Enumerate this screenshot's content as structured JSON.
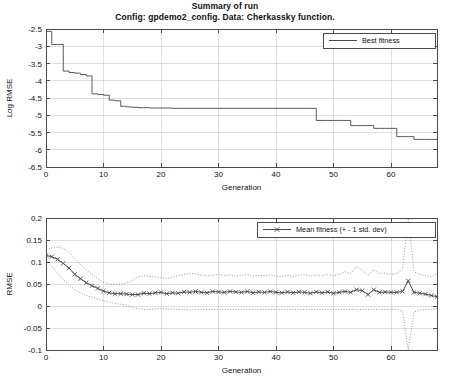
{
  "title": {
    "line1": "Summary of run",
    "line2": "Config: gpdemo2_config. Data: Cherkassky function."
  },
  "colors": {
    "frame": "#4a4a4a",
    "grid": "#c9c9c9",
    "series": "#5a5a5a",
    "band": "#8a8a8a",
    "background": "#ffffff"
  },
  "chart_data": [
    {
      "type": "line",
      "id": "best-fitness-chart",
      "title": "",
      "xlabel": "Generation",
      "ylabel": "Log RMSE",
      "xlim": [
        0,
        68
      ],
      "ylim": [
        -6.5,
        -2.5
      ],
      "xticks": [
        0,
        10,
        20,
        30,
        40,
        50,
        60
      ],
      "yticks": [
        -2.5,
        -3,
        -3.5,
        -4,
        -4.5,
        -5,
        -5.5,
        -6,
        -6.5
      ],
      "grid": true,
      "drawstyle": "steps-post",
      "legend": {
        "position": "top-right",
        "entries": [
          "Best fitness"
        ]
      },
      "series": [
        {
          "name": "Best fitness",
          "style": "step",
          "x": [
            0,
            1,
            2,
            3,
            4,
            5,
            6,
            7,
            8,
            9,
            10,
            11,
            12,
            13,
            14,
            15,
            16,
            17,
            18,
            19,
            20,
            21,
            22,
            23,
            30,
            40,
            46,
            47,
            48,
            49,
            50,
            51,
            52,
            53,
            54,
            55,
            56,
            57,
            58,
            59,
            60,
            61,
            62,
            63,
            64,
            65,
            66,
            67,
            68
          ],
          "y": [
            -2.57,
            -2.95,
            -2.95,
            -3.72,
            -3.76,
            -3.78,
            -3.82,
            -3.86,
            -4.38,
            -4.4,
            -4.42,
            -4.56,
            -4.58,
            -4.74,
            -4.76,
            -4.77,
            -4.78,
            -4.78,
            -4.79,
            -4.79,
            -4.79,
            -4.79,
            -4.8,
            -4.8,
            -4.8,
            -4.8,
            -4.8,
            -5.15,
            -5.15,
            -5.15,
            -5.15,
            -5.15,
            -5.15,
            -5.3,
            -5.3,
            -5.3,
            -5.3,
            -5.38,
            -5.38,
            -5.38,
            -5.38,
            -5.62,
            -5.62,
            -5.62,
            -5.7,
            -5.7,
            -5.7,
            -5.7,
            -5.7
          ]
        }
      ]
    },
    {
      "type": "line",
      "id": "mean-fitness-chart",
      "title": "",
      "xlabel": "Generation",
      "ylabel": "RMSE",
      "xlim": [
        0,
        68
      ],
      "ylim": [
        -0.1,
        0.2
      ],
      "xticks": [
        0,
        10,
        20,
        30,
        40,
        50,
        60
      ],
      "yticks": [
        0.2,
        0.15,
        0.1,
        0.05,
        0,
        -0.05,
        -0.1
      ],
      "grid": true,
      "legend": {
        "position": "top-right",
        "entries": [
          "Mean fitness (+ - 1 std. dev)"
        ]
      },
      "x": [
        0,
        1,
        2,
        3,
        4,
        5,
        6,
        7,
        8,
        9,
        10,
        11,
        12,
        13,
        14,
        15,
        16,
        17,
        18,
        19,
        20,
        21,
        22,
        23,
        24,
        25,
        26,
        27,
        28,
        29,
        30,
        31,
        32,
        33,
        34,
        35,
        36,
        37,
        38,
        39,
        40,
        41,
        42,
        43,
        44,
        45,
        46,
        47,
        48,
        49,
        50,
        51,
        52,
        53,
        54,
        55,
        56,
        57,
        58,
        59,
        60,
        61,
        62,
        63,
        64,
        65,
        66,
        67,
        68
      ],
      "series": [
        {
          "name": "Mean fitness",
          "style": "line-marker",
          "marker": "x",
          "values": [
            0.115,
            0.112,
            0.106,
            0.097,
            0.086,
            0.072,
            0.062,
            0.053,
            0.046,
            0.04,
            0.034,
            0.03,
            0.028,
            0.028,
            0.027,
            0.026,
            0.026,
            0.029,
            0.028,
            0.03,
            0.031,
            0.028,
            0.03,
            0.029,
            0.032,
            0.031,
            0.033,
            0.031,
            0.03,
            0.033,
            0.032,
            0.031,
            0.033,
            0.032,
            0.031,
            0.033,
            0.03,
            0.032,
            0.031,
            0.033,
            0.031,
            0.03,
            0.032,
            0.03,
            0.032,
            0.031,
            0.029,
            0.032,
            0.03,
            0.032,
            0.029,
            0.031,
            0.033,
            0.031,
            0.037,
            0.035,
            0.026,
            0.037,
            0.031,
            0.032,
            0.031,
            0.031,
            0.033,
            0.057,
            0.031,
            0.029,
            0.027,
            0.024,
            0.021
          ]
        },
        {
          "name": "Mean + 1 std. dev",
          "style": "dotted",
          "values": [
            0.128,
            0.132,
            0.134,
            0.131,
            0.122,
            0.108,
            0.094,
            0.082,
            0.072,
            0.062,
            0.054,
            0.05,
            0.049,
            0.05,
            0.052,
            0.058,
            0.066,
            0.069,
            0.067,
            0.066,
            0.064,
            0.062,
            0.066,
            0.069,
            0.072,
            0.074,
            0.073,
            0.07,
            0.068,
            0.07,
            0.072,
            0.069,
            0.071,
            0.068,
            0.07,
            0.072,
            0.068,
            0.07,
            0.069,
            0.071,
            0.068,
            0.067,
            0.07,
            0.067,
            0.07,
            0.072,
            0.068,
            0.071,
            0.069,
            0.072,
            0.069,
            0.072,
            0.078,
            0.074,
            0.09,
            0.081,
            0.07,
            0.082,
            0.074,
            0.075,
            0.072,
            0.074,
            0.082,
            0.2,
            0.078,
            0.072,
            0.069,
            0.066,
            0.074
          ]
        },
        {
          "name": "Mean - 1 std. dev",
          "style": "dotted",
          "values": [
            0.103,
            0.09,
            0.076,
            0.06,
            0.048,
            0.037,
            0.03,
            0.024,
            0.02,
            0.016,
            0.012,
            0.008,
            0.006,
            0.004,
            0.002,
            -0.003,
            -0.006,
            -0.008,
            -0.008,
            -0.007,
            -0.006,
            -0.007,
            -0.007,
            -0.008,
            -0.008,
            -0.009,
            -0.008,
            -0.008,
            -0.008,
            -0.008,
            -0.008,
            -0.008,
            -0.008,
            -0.008,
            -0.008,
            -0.008,
            -0.008,
            -0.008,
            -0.008,
            -0.008,
            -0.008,
            -0.008,
            -0.008,
            -0.008,
            -0.008,
            -0.008,
            -0.008,
            -0.008,
            -0.008,
            -0.008,
            -0.008,
            -0.008,
            -0.008,
            -0.008,
            -0.008,
            -0.008,
            -0.008,
            -0.008,
            -0.008,
            -0.008,
            -0.008,
            -0.008,
            -0.012,
            -0.1,
            -0.014,
            -0.009,
            -0.008,
            -0.008,
            -0.006
          ]
        }
      ]
    }
  ]
}
